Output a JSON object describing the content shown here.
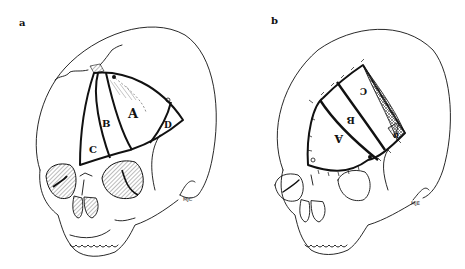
{
  "figure": {
    "panels": [
      {
        "id": "a",
        "label": "a",
        "signature": "MJC",
        "description": "Skull in three-quarter frontal view showing planned fronto-temporal flap segments before transposition",
        "flap_segments": [
          "A",
          "B",
          "C",
          "D"
        ]
      },
      {
        "id": "b",
        "label": "b",
        "signature": "MJE",
        "description": "Skull showing rotated and sutured flap segments after repositioning (segments inverted)",
        "flap_segments": [
          "A",
          "B",
          "C",
          "D"
        ]
      }
    ],
    "colors": {
      "line": "#111111",
      "hatch": "#555555",
      "background": "#ffffff"
    }
  }
}
